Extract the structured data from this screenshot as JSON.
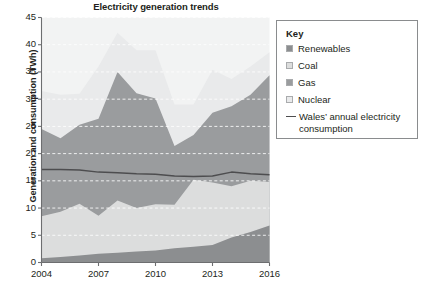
{
  "chart_data": {
    "type": "area",
    "title": "Electricity generation trends",
    "xlabel": "",
    "ylabel": "Generation and consumption (TWh)",
    "xlim": [
      2004,
      2016
    ],
    "ylim": [
      0,
      45
    ],
    "ytick_step": 5,
    "yticks": [
      "0",
      "5",
      "10",
      "15",
      "20",
      "25",
      "30",
      "35",
      "40",
      "45"
    ],
    "xticks": [
      "2004",
      "2007",
      "2010",
      "2013",
      "2016"
    ],
    "x": [
      2004,
      2005,
      2006,
      2007,
      2008,
      2009,
      2010,
      2011,
      2012,
      2013,
      2014,
      2015,
      2016
    ],
    "grid": "horizontal-dashed-white",
    "legend_position": "right-outside",
    "stacked": true,
    "series": [
      {
        "name": "Renewables",
        "color": "#8c8e90",
        "values": [
          0.8,
          1.0,
          1.3,
          1.6,
          1.8,
          2.0,
          2.2,
          2.6,
          2.9,
          3.2,
          4.6,
          5.6,
          6.8
        ]
      },
      {
        "name": "Coal",
        "color": "#dcdddd",
        "values": [
          7.7,
          8.3,
          9.5,
          7.0,
          9.6,
          8.0,
          8.5,
          8.0,
          12.3,
          11.5,
          9.4,
          9.4,
          8.0
        ]
      },
      {
        "name": "Gas",
        "color": "#9a9c9e",
        "values": [
          16.0,
          13.5,
          14.5,
          17.8,
          23.6,
          21.1,
          19.4,
          10.8,
          8.2,
          12.8,
          14.7,
          15.8,
          19.6
        ]
      },
      {
        "name": "Nuclear",
        "color": "#e9eaeb",
        "values": [
          7.0,
          8.0,
          5.7,
          9.6,
          7.2,
          7.9,
          8.9,
          7.6,
          5.6,
          7.9,
          5.0,
          5.2,
          4.2
        ]
      }
    ],
    "line_series": {
      "name": "Wales’ annual electricity consumption",
      "color": "#4d4d4f",
      "values": [
        17.1,
        17.1,
        17.0,
        16.6,
        16.5,
        16.3,
        16.2,
        15.9,
        15.8,
        15.9,
        16.6,
        16.3,
        16.1
      ]
    }
  },
  "legend": {
    "title": "Key",
    "items": [
      {
        "label": "Renewables",
        "marker": "swatch",
        "color": "#8c8e90"
      },
      {
        "label": "Coal",
        "marker": "swatch",
        "color": "#dcdddd"
      },
      {
        "label": "Gas",
        "marker": "swatch",
        "color": "#9a9c9e"
      },
      {
        "label": "Nuclear",
        "marker": "swatch",
        "color": "#e9eaeb"
      },
      {
        "label": "Wales’ annual electricity consumption",
        "marker": "line",
        "color": "#4d4d4f"
      }
    ]
  },
  "axis": {
    "color": "#6d6e70",
    "gridline_color": "#ffffff"
  }
}
